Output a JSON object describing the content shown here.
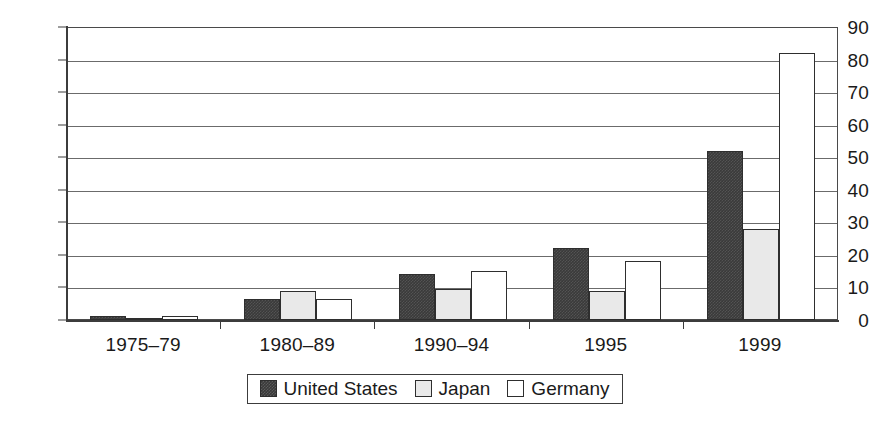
{
  "chart_data": {
    "type": "bar",
    "title": "",
    "subtitle": "",
    "xlabel": "",
    "ylabel": "",
    "ylim": [
      0,
      90
    ],
    "ytick_values": [
      0,
      10,
      20,
      30,
      40,
      50,
      60,
      70,
      80,
      90
    ],
    "ytick_labels": [
      "0",
      "10",
      "20",
      "30",
      "40",
      "50",
      "60",
      "70",
      "80",
      "90"
    ],
    "grid": "horizontal",
    "legend_position": "bottom-center",
    "categories": [
      "1975–79",
      "1980–89",
      "1990–94",
      "1995",
      "1999"
    ],
    "series": [
      {
        "name": "United States",
        "color": "#3a3a3a",
        "values": [
          1.2,
          6.5,
          14,
          22,
          52
        ]
      },
      {
        "name": "Japan",
        "color": "#e9e9e9",
        "values": [
          0.4,
          9,
          9.5,
          9,
          28
        ]
      },
      {
        "name": "Germany",
        "color": "#ffffff",
        "values": [
          1.2,
          6.5,
          15,
          18,
          82
        ]
      }
    ]
  },
  "legend": {
    "items": [
      {
        "label": "United States",
        "swatch": "us"
      },
      {
        "label": "Japan",
        "swatch": "jp"
      },
      {
        "label": "Germany",
        "swatch": "de"
      }
    ]
  },
  "axis": {
    "y_label_text": "",
    "x_label_text": ""
  },
  "colors": {
    "united_states": "#3a3a3a",
    "japan": "#e9e9e9",
    "germany": "#ffffff",
    "axis": "#3c3c3c",
    "gridline": "#6b6b6b",
    "background": "#ffffff",
    "text": "#1a1a1a"
  }
}
